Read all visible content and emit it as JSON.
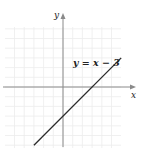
{
  "chart_data": {
    "type": "line",
    "title": "",
    "equation_label": "y = x − 3",
    "xlabel": "x",
    "ylabel": "y",
    "series": [
      {
        "name": "y = x - 3",
        "x": [
          -3,
          6
        ],
        "y": [
          -6,
          3
        ]
      }
    ],
    "x_intercept": 3,
    "y_intercept": -3,
    "xlim": [
      -6,
      6
    ],
    "ylim": [
      -6,
      6
    ],
    "grid": true,
    "legend": "none",
    "annotations": [
      {
        "text": "y = x − 3",
        "near": [
          4,
          4
        ]
      }
    ]
  },
  "labels": {
    "x_axis": "x",
    "y_axis": "y",
    "equation": "y = x − 3",
    "top_cut": ""
  },
  "colors": {
    "grid": "#ececec",
    "axis": "#888888",
    "line": "#2a2a2a"
  }
}
